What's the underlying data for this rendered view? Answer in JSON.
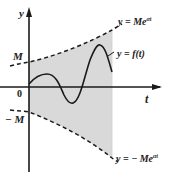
{
  "figure": {
    "axes": {
      "x_label": "t",
      "y_label": "y",
      "origin_label": "0"
    },
    "ticks": {
      "upper": "M",
      "lower": "− M"
    },
    "curves": {
      "upper_bound": {
        "label": "y = Me",
        "exp": "αt"
      },
      "lower_bound": {
        "label": "y = − Me",
        "exp": "αt"
      },
      "function": {
        "label": "y = f(t)"
      }
    },
    "colors": {
      "shade": "#d9d9d9",
      "stroke": "#1a1a1a",
      "text": "#222222"
    }
  }
}
